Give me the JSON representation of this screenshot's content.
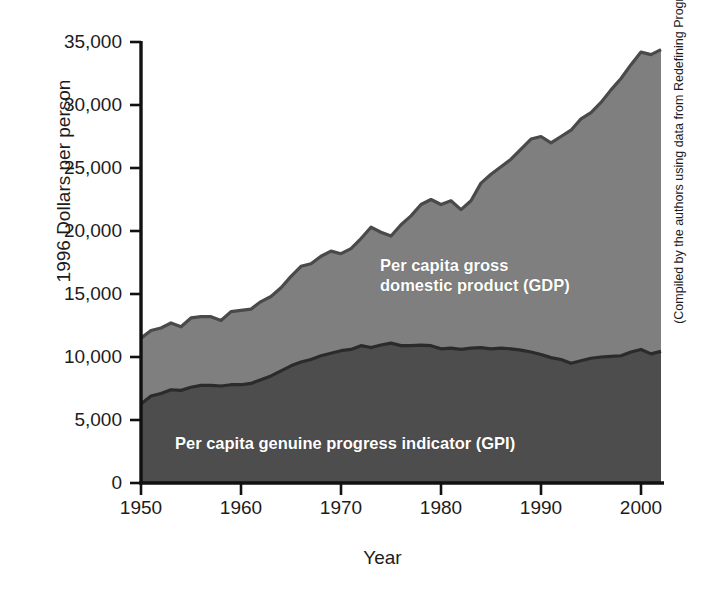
{
  "chart_data": {
    "type": "area",
    "title": "",
    "xlabel": "Year",
    "ylabel": "1996 Dollars per person",
    "xlim": [
      1950,
      2002
    ],
    "ylim": [
      0,
      35000
    ],
    "grid": false,
    "legend_position": "inside-plot-labels",
    "stacked": false,
    "xticks": [
      "1950",
      "1960",
      "1970",
      "1980",
      "1990",
      "2000"
    ],
    "xtick_values": [
      1950,
      1960,
      1970,
      1980,
      1990,
      2000
    ],
    "yticks": [
      "0",
      "5,000",
      "10,000",
      "15,000",
      "20,000",
      "25,000",
      "30,000",
      "35,000"
    ],
    "ytick_values": [
      0,
      5000,
      10000,
      15000,
      20000,
      25000,
      30000,
      35000
    ],
    "annotations": [
      {
        "name": "gdp-area-label",
        "text": "Per capita gross\ndomestic product (GDP)",
        "color": "#ffffff"
      },
      {
        "name": "gpi-area-label",
        "text": "Per capita genuine progress indicator (GPI)",
        "color": "#ffffff"
      }
    ],
    "credit": "(Compiled by the authors using data from Redefining Progress.)",
    "x": [
      1950,
      1951,
      1952,
      1953,
      1954,
      1955,
      1956,
      1957,
      1958,
      1959,
      1960,
      1961,
      1962,
      1963,
      1964,
      1965,
      1966,
      1967,
      1968,
      1969,
      1970,
      1971,
      1972,
      1973,
      1974,
      1975,
      1976,
      1977,
      1978,
      1979,
      1980,
      1981,
      1982,
      1983,
      1984,
      1985,
      1986,
      1987,
      1988,
      1989,
      1990,
      1991,
      1992,
      1993,
      1994,
      1995,
      1996,
      1997,
      1998,
      1999,
      2000,
      2001,
      2002
    ],
    "series": [
      {
        "name": "Per capita gross domestic product (GDP)",
        "color": "#7f7f7f",
        "line_color": "#4a4a4a",
        "values": [
          11500,
          12100,
          12300,
          12700,
          12400,
          13100,
          13200,
          13200,
          12900,
          13600,
          13700,
          13800,
          14400,
          14800,
          15500,
          16400,
          17200,
          17400,
          18000,
          18400,
          18200,
          18600,
          19400,
          20300,
          19900,
          19600,
          20500,
          21200,
          22100,
          22500,
          22100,
          22400,
          21700,
          22400,
          23800,
          24500,
          25100,
          25700,
          26500,
          27300,
          27500,
          27000,
          27500,
          28000,
          28900,
          29400,
          30200,
          31200,
          32100,
          33200,
          34200,
          34000,
          34400
        ]
      },
      {
        "name": "Per capita genuine progress indicator (GPI)",
        "color": "#4d4d4d",
        "line_color": "#2b2b2b",
        "values": [
          6270,
          6900,
          7100,
          7400,
          7350,
          7600,
          7750,
          7750,
          7700,
          7800,
          7800,
          7900,
          8200,
          8500,
          8900,
          9300,
          9600,
          9800,
          10100,
          10300,
          10500,
          10600,
          10900,
          10750,
          10950,
          11100,
          10900,
          10900,
          10950,
          10900,
          10650,
          10700,
          10600,
          10700,
          10750,
          10650,
          10700,
          10650,
          10550,
          10400,
          10200,
          9950,
          9800,
          9500,
          9700,
          9900,
          10000,
          10050,
          10100,
          10400,
          10600,
          10250,
          10450
        ]
      }
    ]
  },
  "axes": {
    "ylabel": "1996 Dollars per person",
    "xlabel": "Year"
  },
  "credit_text": "(Compiled by the authors using data from Redefining Progress.)",
  "labels": {
    "gdp_line1": "Per capita gross",
    "gdp_line2": "domestic product (GDP)",
    "gpi": "Per capita genuine progress indicator (GPI)"
  },
  "colors": {
    "gdp_fill": "#7f7f7f",
    "gpi_fill": "#4d4d4d",
    "gdp_line": "#4a4a4a",
    "gpi_line": "#2b2b2b",
    "axis": "#111111",
    "background": "#ffffff",
    "label_text": "#ffffff"
  }
}
